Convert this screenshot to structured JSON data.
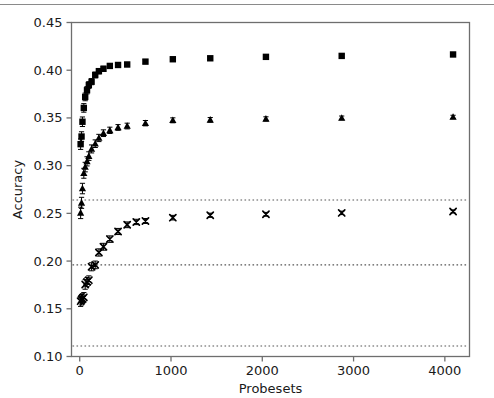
{
  "chart_data": {
    "type": "scatter",
    "title": "",
    "xlabel": "Probesets",
    "ylabel": "Accuracy",
    "xlim": [
      -90,
      4270
    ],
    "ylim": [
      0.1,
      0.45
    ],
    "grid": false,
    "legend": "none",
    "xticks": [
      0,
      1000,
      2000,
      3000,
      4000
    ],
    "xticklabels": [
      "0",
      "1000",
      "2000",
      "3000",
      "4000"
    ],
    "yticks": [
      0.1,
      0.15,
      0.2,
      0.25,
      0.3,
      0.35,
      0.4,
      0.45
    ],
    "yticklabels": [
      "0.10",
      "0.15",
      "0.20",
      "0.25",
      "0.30",
      "0.35",
      "0.40",
      "0.45"
    ],
    "series": [
      {
        "name": "squares",
        "marker": "square",
        "color": "#000000",
        "errorbars": true,
        "points": [
          {
            "x": 10,
            "y": 0.3225,
            "err": 0.0055
          },
          {
            "x": 20,
            "y": 0.3305,
            "err": 0.005
          },
          {
            "x": 30,
            "y": 0.346,
            "err": 0.005
          },
          {
            "x": 45,
            "y": 0.3605,
            "err": 0.0045
          },
          {
            "x": 60,
            "y": 0.372,
            "err": 0.004
          },
          {
            "x": 80,
            "y": 0.379,
            "err": 0.0038
          },
          {
            "x": 100,
            "y": 0.3845,
            "err": 0.0035
          },
          {
            "x": 130,
            "y": 0.388,
            "err": 0.0032
          },
          {
            "x": 170,
            "y": 0.395,
            "err": 0.003
          },
          {
            "x": 210,
            "y": 0.399,
            "err": 0.0028
          },
          {
            "x": 260,
            "y": 0.4015,
            "err": 0.0026
          },
          {
            "x": 330,
            "y": 0.4045,
            "err": 0.0024
          },
          {
            "x": 420,
            "y": 0.4055,
            "err": 0.0022
          },
          {
            "x": 520,
            "y": 0.406,
            "err": 0.0022
          },
          {
            "x": 720,
            "y": 0.409,
            "err": 0.002
          },
          {
            "x": 1020,
            "y": 0.4115,
            "err": 0.0018
          },
          {
            "x": 1430,
            "y": 0.4125,
            "err": 0.0017
          },
          {
            "x": 2040,
            "y": 0.414,
            "err": 0.0016
          },
          {
            "x": 2870,
            "y": 0.415,
            "err": 0.0015
          },
          {
            "x": 4090,
            "y": 0.4165,
            "err": 0.0014
          }
        ]
      },
      {
        "name": "triangles",
        "marker": "triangle",
        "color": "#000000",
        "errorbars": true,
        "points": [
          {
            "x": 10,
            "y": 0.2505,
            "err": 0.006
          },
          {
            "x": 20,
            "y": 0.261,
            "err": 0.0058
          },
          {
            "x": 30,
            "y": 0.276,
            "err": 0.0055
          },
          {
            "x": 45,
            "y": 0.292,
            "err": 0.0052
          },
          {
            "x": 60,
            "y": 0.2985,
            "err": 0.005
          },
          {
            "x": 80,
            "y": 0.3045,
            "err": 0.0048
          },
          {
            "x": 100,
            "y": 0.31,
            "err": 0.0045
          },
          {
            "x": 130,
            "y": 0.3175,
            "err": 0.0042
          },
          {
            "x": 170,
            "y": 0.323,
            "err": 0.004
          },
          {
            "x": 210,
            "y": 0.329,
            "err": 0.0038
          },
          {
            "x": 260,
            "y": 0.334,
            "err": 0.0035
          },
          {
            "x": 330,
            "y": 0.337,
            "err": 0.0033
          },
          {
            "x": 420,
            "y": 0.34,
            "err": 0.003
          },
          {
            "x": 520,
            "y": 0.3415,
            "err": 0.003
          },
          {
            "x": 720,
            "y": 0.3445,
            "err": 0.0028
          },
          {
            "x": 1020,
            "y": 0.3475,
            "err": 0.0026
          },
          {
            "x": 1430,
            "y": 0.348,
            "err": 0.0024
          },
          {
            "x": 2040,
            "y": 0.349,
            "err": 0.0022
          },
          {
            "x": 2870,
            "y": 0.35,
            "err": 0.002
          },
          {
            "x": 4090,
            "y": 0.351,
            "err": 0.0018
          }
        ]
      },
      {
        "name": "x-markers",
        "marker": "x",
        "color": "#000000",
        "errorbars": true,
        "points": [
          {
            "x": 10,
            "y": 0.158,
            "err": 0.0055
          },
          {
            "x": 20,
            "y": 0.1595,
            "err": 0.0055
          },
          {
            "x": 30,
            "y": 0.1605,
            "err": 0.0052
          },
          {
            "x": 45,
            "y": 0.162,
            "err": 0.005
          },
          {
            "x": 60,
            "y": 0.1755,
            "err": 0.005
          },
          {
            "x": 80,
            "y": 0.178,
            "err": 0.0048
          },
          {
            "x": 100,
            "y": 0.18,
            "err": 0.0045
          },
          {
            "x": 130,
            "y": 0.194,
            "err": 0.0042
          },
          {
            "x": 170,
            "y": 0.196,
            "err": 0.004
          },
          {
            "x": 210,
            "y": 0.209,
            "err": 0.0038
          },
          {
            "x": 260,
            "y": 0.215,
            "err": 0.0036
          },
          {
            "x": 330,
            "y": 0.223,
            "err": 0.0034
          },
          {
            "x": 420,
            "y": 0.231,
            "err": 0.0032
          },
          {
            "x": 520,
            "y": 0.238,
            "err": 0.003
          },
          {
            "x": 620,
            "y": 0.241,
            "err": 0.0028
          },
          {
            "x": 720,
            "y": 0.242,
            "err": 0.0026
          },
          {
            "x": 1020,
            "y": 0.2455,
            "err": 0.0024
          },
          {
            "x": 1430,
            "y": 0.248,
            "err": 0.0022
          },
          {
            "x": 2040,
            "y": 0.249,
            "err": 0.002
          },
          {
            "x": 2870,
            "y": 0.2505,
            "err": 0.0018
          },
          {
            "x": 4090,
            "y": 0.252,
            "err": 0.0016
          }
        ]
      }
    ],
    "reference_lines": [
      {
        "name": "upper-reference-line",
        "y": 0.264,
        "style": "dotted",
        "color": "#555555"
      },
      {
        "name": "middle-reference-line",
        "y": 0.196,
        "style": "dotted",
        "color": "#555555"
      },
      {
        "name": "lower-reference-line",
        "y": 0.111,
        "style": "dotted",
        "color": "#555555"
      }
    ]
  }
}
